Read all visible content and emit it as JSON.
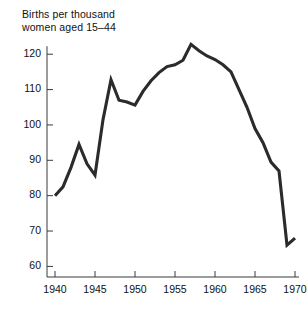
{
  "chart_data": {
    "type": "line",
    "title": "Births per thousand\nwomen aged 15–44",
    "xlabel": "",
    "ylabel": "",
    "xlim": [
      1939,
      1970.5
    ],
    "ylim": [
      57,
      126
    ],
    "grid": false,
    "legend": null,
    "x_ticks": [
      1940,
      1945,
      1950,
      1955,
      1960,
      1965,
      1970
    ],
    "x_tick_labels": [
      "1940",
      "1945",
      "1950",
      "1955",
      "1960",
      "1965",
      "1970"
    ],
    "y_ticks": [
      60,
      70,
      80,
      90,
      100,
      110,
      120
    ],
    "y_tick_labels": [
      "60",
      "70",
      "80",
      "90",
      "100",
      "110",
      "120"
    ],
    "series": [
      {
        "name": "Births per thousand women aged 15-44",
        "color": "#2b2b2b",
        "x": [
          1940,
          1941,
          1942,
          1943,
          1944,
          1945,
          1946,
          1947,
          1948,
          1949,
          1950,
          1951,
          1952,
          1953,
          1954,
          1955,
          1956,
          1957,
          1958,
          1959,
          1960,
          1961,
          1962,
          1963,
          1964,
          1965,
          1966,
          1967,
          1968,
          1969,
          1970
        ],
        "values": [
          80.0,
          82.5,
          88.0,
          94.5,
          89.0,
          85.8,
          101.5,
          112.8,
          107.0,
          106.5,
          105.6,
          109.5,
          112.5,
          114.8,
          116.5,
          117.0,
          118.3,
          122.8,
          121.0,
          119.5,
          118.5,
          117.0,
          115.0,
          110.0,
          105.0,
          99.0,
          95.0,
          89.5,
          87.0,
          66.0,
          68.0
        ]
      }
    ]
  }
}
